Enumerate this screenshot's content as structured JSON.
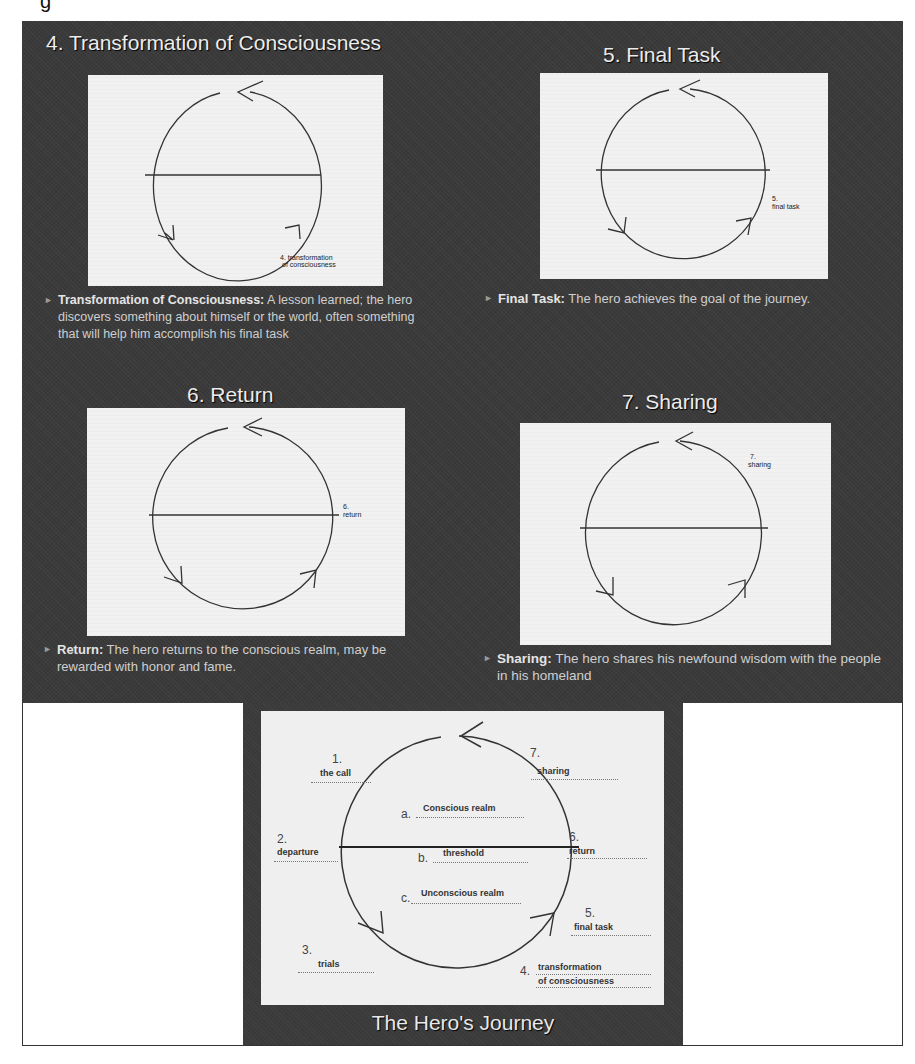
{
  "partial_header_glyph": "g",
  "slides": [
    {
      "title": "4. Transformation of Consciousness",
      "diagram_label_line1": "4. transformation",
      "diagram_label_line2": "of consciousness",
      "term": "Transformation of Consciousness:",
      "description": " A lesson learned; the hero discovers something about himself or the world, often something that will help him accomplish his final task"
    },
    {
      "title": "5. Final Task",
      "diagram_label_line1": "5.",
      "diagram_label_line2": "final task",
      "term": "Final Task:",
      "description": " The hero achieves the goal of the journey."
    },
    {
      "title": "6. Return",
      "diagram_label_line1": "6.",
      "diagram_label_line2": "return",
      "term": "Return:",
      "description": " The hero returns to the conscious realm, may be rewarded with honor and fame."
    },
    {
      "title": "7. Sharing",
      "diagram_label_line1": "7.",
      "diagram_label_line2": "sharing",
      "term": "Sharing:",
      "description": " The hero shares his newfound wisdom with the people in his homeland"
    }
  ],
  "summary_slide": {
    "title": "The Hero's Journey",
    "stages": [
      {
        "num": "1.",
        "label": "the call"
      },
      {
        "num": "2.",
        "label": "departure"
      },
      {
        "num": "3.",
        "label": "trials"
      },
      {
        "num": "4.",
        "label": "transformation",
        "label2": "of consciousness"
      },
      {
        "num": "5.",
        "label": "final task"
      },
      {
        "num": "6.",
        "label": "return"
      },
      {
        "num": "7.",
        "label": "sharing"
      }
    ],
    "realms": [
      {
        "letter": "a.",
        "label": "Conscious realm"
      },
      {
        "letter": "b.",
        "label": "threshold"
      },
      {
        "letter": "c.",
        "label": "Unconscious realm"
      }
    ]
  }
}
